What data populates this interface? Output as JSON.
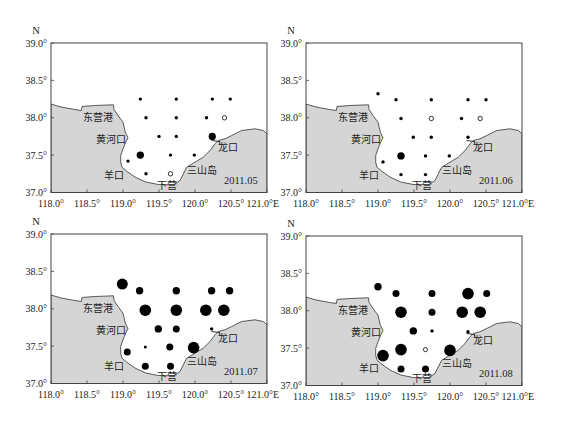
{
  "figure": {
    "axis_label_n": "N",
    "axis_label_e_suffix": "E"
  },
  "map": {
    "land_color": "#d5d5d5",
    "sea_color": "#ffffff",
    "frame_color": "#444444",
    "coast_color": "#333333",
    "dot_color": "#000000",
    "coastline": [
      [
        118.0,
        38.184
      ],
      [
        118.139,
        38.144
      ],
      [
        118.329,
        38.11
      ],
      [
        118.421,
        38.097
      ],
      [
        118.431,
        38.151
      ],
      [
        118.607,
        38.164
      ],
      [
        118.868,
        38.173
      ],
      [
        118.875,
        38.11
      ],
      [
        118.931,
        38.03
      ],
      [
        119.0,
        37.94
      ],
      [
        119.032,
        37.807
      ],
      [
        119.069,
        37.732
      ],
      [
        119.038,
        37.673
      ],
      [
        119.0,
        37.585
      ],
      [
        118.968,
        37.495
      ],
      [
        118.968,
        37.405
      ],
      [
        118.986,
        37.339
      ],
      [
        119.069,
        37.272
      ],
      [
        119.167,
        37.207
      ],
      [
        119.315,
        37.14
      ],
      [
        119.49,
        37.107
      ],
      [
        119.699,
        37.103
      ],
      [
        119.792,
        37.16
      ],
      [
        119.838,
        37.25
      ],
      [
        119.885,
        37.339
      ],
      [
        120.0,
        37.405
      ],
      [
        120.115,
        37.472
      ],
      [
        120.208,
        37.562
      ],
      [
        120.278,
        37.652
      ],
      [
        120.324,
        37.696
      ],
      [
        120.417,
        37.718
      ],
      [
        120.51,
        37.763
      ],
      [
        120.649,
        37.829
      ],
      [
        120.833,
        37.852
      ],
      [
        120.949,
        37.829
      ],
      [
        121.0,
        37.785
      ]
    ],
    "longkou_pier": [
      [
        120.229,
        37.696
      ],
      [
        120.34,
        37.682
      ],
      [
        120.347,
        37.636
      ]
    ],
    "place_labels": [
      {
        "id": "dongying-port",
        "text": "东营港",
        "lon": 118.44,
        "lat": 38.0
      },
      {
        "id": "yellow-river-mouth",
        "text": "黄河口",
        "lon": 118.62,
        "lat": 37.705
      },
      {
        "id": "longkou",
        "text": "龙口",
        "lon": 120.324,
        "lat": 37.606
      },
      {
        "id": "sanshan-island",
        "text": "三山岛",
        "lon": 119.893,
        "lat": 37.294
      },
      {
        "id": "yangkou",
        "text": "羊口",
        "lon": 118.74,
        "lat": 37.227
      },
      {
        "id": "xiaying",
        "text": "下营",
        "lon": 119.468,
        "lat": 37.094
      }
    ],
    "date_label_position": {
      "lon": 120.403,
      "lat": 37.161
    }
  },
  "chart_data": [
    {
      "type": "scatter",
      "subtype": "bubble-map",
      "title": "2011.05",
      "xlabel": "E",
      "ylabel": "N",
      "xlim": [
        118.0,
        121.0
      ],
      "ylim": [
        37.0,
        39.0
      ],
      "xticks": [
        118.0,
        118.5,
        119.0,
        119.5,
        120.0,
        120.5,
        121.0
      ],
      "xtick_labels": [
        "118.0°",
        "118.5°",
        "119.0°",
        "119.5°",
        "120.0°",
        "120.5°",
        "121.0°E"
      ],
      "yticks": [
        37.0,
        37.5,
        38.0,
        38.5,
        39.0
      ],
      "ytick_labels": [
        "37.0°",
        "37.5°",
        "38.0°",
        "38.5°",
        "39.0°"
      ],
      "grid": false,
      "points": [
        {
          "lon": 119.24,
          "lat": 38.25,
          "r": 1.7,
          "filled": true
        },
        {
          "lon": 119.74,
          "lat": 38.25,
          "r": 1.7,
          "filled": true
        },
        {
          "lon": 120.24,
          "lat": 38.25,
          "r": 1.7,
          "filled": true
        },
        {
          "lon": 120.49,
          "lat": 38.25,
          "r": 1.7,
          "filled": true
        },
        {
          "lon": 119.32,
          "lat": 38.0,
          "r": 1.7,
          "filled": true
        },
        {
          "lon": 119.74,
          "lat": 38.0,
          "r": 1.7,
          "filled": true
        },
        {
          "lon": 120.16,
          "lat": 38.0,
          "r": 1.7,
          "filled": true
        },
        {
          "lon": 120.41,
          "lat": 38.0,
          "r": 2.2,
          "filled": false
        },
        {
          "lon": 119.5,
          "lat": 37.75,
          "r": 1.7,
          "filled": true
        },
        {
          "lon": 119.74,
          "lat": 37.75,
          "r": 1.7,
          "filled": true
        },
        {
          "lon": 120.24,
          "lat": 37.75,
          "r": 3.6,
          "filled": true
        },
        {
          "lon": 119.24,
          "lat": 37.5,
          "r": 3.7,
          "filled": true
        },
        {
          "lon": 119.66,
          "lat": 37.5,
          "r": 1.7,
          "filled": true
        },
        {
          "lon": 119.99,
          "lat": 37.5,
          "r": 1.7,
          "filled": true
        },
        {
          "lon": 119.07,
          "lat": 37.42,
          "r": 1.7,
          "filled": true
        },
        {
          "lon": 119.32,
          "lat": 37.25,
          "r": 1.7,
          "filled": true
        },
        {
          "lon": 119.66,
          "lat": 37.25,
          "r": 2.2,
          "filled": false
        }
      ]
    },
    {
      "type": "scatter",
      "subtype": "bubble-map",
      "title": "2011.06",
      "xlabel": "E",
      "ylabel": "N",
      "xlim": [
        118.0,
        121.0
      ],
      "ylim": [
        37.0,
        39.0
      ],
      "xticks": [
        118.0,
        118.5,
        119.0,
        119.5,
        120.0,
        120.5,
        121.0
      ],
      "xtick_labels": [
        "118.0°",
        "118.5°",
        "119.0°",
        "119.5°",
        "120.0°",
        "120.5°",
        "121.0°E"
      ],
      "yticks": [
        37.0,
        37.5,
        38.0,
        38.5,
        39.0
      ],
      "ytick_labels": [
        "37.0°",
        "37.5°",
        "38.0°",
        "38.5°",
        "39.0°"
      ],
      "grid": false,
      "points": [
        {
          "lon": 119.0,
          "lat": 38.32,
          "r": 1.7,
          "filled": true
        },
        {
          "lon": 119.25,
          "lat": 38.24,
          "r": 1.7,
          "filled": true
        },
        {
          "lon": 119.74,
          "lat": 38.24,
          "r": 1.7,
          "filled": true
        },
        {
          "lon": 120.25,
          "lat": 38.24,
          "r": 1.7,
          "filled": true
        },
        {
          "lon": 120.5,
          "lat": 38.24,
          "r": 1.7,
          "filled": true
        },
        {
          "lon": 119.32,
          "lat": 37.99,
          "r": 1.7,
          "filled": true
        },
        {
          "lon": 119.74,
          "lat": 37.99,
          "r": 2.2,
          "filled": false
        },
        {
          "lon": 120.16,
          "lat": 37.99,
          "r": 1.7,
          "filled": true
        },
        {
          "lon": 120.42,
          "lat": 37.99,
          "r": 2.2,
          "filled": false
        },
        {
          "lon": 119.49,
          "lat": 37.74,
          "r": 1.7,
          "filled": true
        },
        {
          "lon": 119.74,
          "lat": 37.74,
          "r": 1.7,
          "filled": true
        },
        {
          "lon": 120.25,
          "lat": 37.74,
          "r": 1.7,
          "filled": true
        },
        {
          "lon": 119.32,
          "lat": 37.49,
          "r": 3.7,
          "filled": true
        },
        {
          "lon": 119.66,
          "lat": 37.49,
          "r": 1.7,
          "filled": true
        },
        {
          "lon": 119.99,
          "lat": 37.49,
          "r": 1.7,
          "filled": true
        },
        {
          "lon": 119.07,
          "lat": 37.41,
          "r": 1.7,
          "filled": true
        },
        {
          "lon": 119.32,
          "lat": 37.24,
          "r": 1.7,
          "filled": true
        },
        {
          "lon": 119.66,
          "lat": 37.24,
          "r": 1.7,
          "filled": true
        }
      ]
    },
    {
      "type": "scatter",
      "subtype": "bubble-map",
      "title": "2011.07",
      "xlabel": "E",
      "ylabel": "N",
      "xlim": [
        118.0,
        121.0
      ],
      "ylim": [
        37.0,
        39.0
      ],
      "xticks": [
        118.0,
        118.5,
        119.0,
        119.5,
        120.0,
        120.5,
        121.0
      ],
      "xtick_labels": [
        "118.0°",
        "118.5°",
        "119.0°",
        "119.5°",
        "120.0°",
        "120.5°",
        "121.0°E"
      ],
      "yticks": [
        37.0,
        37.5,
        38.0,
        38.5,
        39.0
      ],
      "ytick_labels": [
        "37.0°",
        "37.5°",
        "38.0°",
        "38.5°",
        "39.0°"
      ],
      "grid": false,
      "points": [
        {
          "lon": 118.99,
          "lat": 38.33,
          "r": 5.5,
          "filled": true
        },
        {
          "lon": 119.23,
          "lat": 38.24,
          "r": 3.7,
          "filled": true
        },
        {
          "lon": 119.74,
          "lat": 38.24,
          "r": 3.7,
          "filled": true
        },
        {
          "lon": 120.23,
          "lat": 38.24,
          "r": 3.7,
          "filled": true
        },
        {
          "lon": 120.48,
          "lat": 38.24,
          "r": 3.7,
          "filled": true
        },
        {
          "lon": 119.31,
          "lat": 37.98,
          "r": 5.8,
          "filled": true
        },
        {
          "lon": 119.74,
          "lat": 37.98,
          "r": 5.8,
          "filled": true
        },
        {
          "lon": 120.15,
          "lat": 37.98,
          "r": 5.8,
          "filled": true
        },
        {
          "lon": 120.4,
          "lat": 37.98,
          "r": 5.8,
          "filled": true
        },
        {
          "lon": 119.49,
          "lat": 37.73,
          "r": 3.7,
          "filled": true
        },
        {
          "lon": 119.74,
          "lat": 37.73,
          "r": 3.5,
          "filled": true
        },
        {
          "lon": 120.23,
          "lat": 37.73,
          "r": 1.7,
          "filled": true
        },
        {
          "lon": 119.31,
          "lat": 37.49,
          "r": 1.5,
          "filled": true
        },
        {
          "lon": 119.65,
          "lat": 37.49,
          "r": 3.5,
          "filled": true
        },
        {
          "lon": 119.98,
          "lat": 37.48,
          "r": 5.8,
          "filled": true
        },
        {
          "lon": 119.06,
          "lat": 37.42,
          "r": 3.5,
          "filled": true
        },
        {
          "lon": 119.31,
          "lat": 37.23,
          "r": 3.5,
          "filled": true
        },
        {
          "lon": 119.66,
          "lat": 37.23,
          "r": 3.5,
          "filled": true
        }
      ]
    },
    {
      "type": "scatter",
      "subtype": "bubble-map",
      "title": "2011.08",
      "xlabel": "E",
      "ylabel": "N",
      "xlim": [
        118.0,
        121.0
      ],
      "ylim": [
        37.0,
        39.0
      ],
      "xticks": [
        118.0,
        118.5,
        119.0,
        119.5,
        120.0,
        120.5,
        121.0
      ],
      "xtick_labels": [
        "118.0°",
        "118.5°",
        "119.0°",
        "119.5°",
        "120.0°",
        "120.5°",
        "121.0°E"
      ],
      "yticks": [
        37.0,
        37.5,
        38.0,
        38.5,
        39.0
      ],
      "ytick_labels": [
        "37.0°",
        "37.5°",
        "38.0°",
        "38.5°",
        "39.0°"
      ],
      "grid": false,
      "points": [
        {
          "lon": 119.0,
          "lat": 38.32,
          "r": 3.7,
          "filled": true
        },
        {
          "lon": 119.25,
          "lat": 38.23,
          "r": 3.5,
          "filled": true
        },
        {
          "lon": 119.75,
          "lat": 38.23,
          "r": 3.5,
          "filled": true
        },
        {
          "lon": 120.25,
          "lat": 38.23,
          "r": 5.8,
          "filled": true
        },
        {
          "lon": 120.51,
          "lat": 38.23,
          "r": 3.5,
          "filled": true
        },
        {
          "lon": 119.32,
          "lat": 37.98,
          "r": 5.8,
          "filled": true
        },
        {
          "lon": 119.75,
          "lat": 37.98,
          "r": 3.5,
          "filled": true
        },
        {
          "lon": 120.17,
          "lat": 37.98,
          "r": 5.8,
          "filled": true
        },
        {
          "lon": 120.42,
          "lat": 37.98,
          "r": 5.8,
          "filled": true
        },
        {
          "lon": 119.49,
          "lat": 37.73,
          "r": 3.7,
          "filled": true
        },
        {
          "lon": 119.75,
          "lat": 37.73,
          "r": 1.7,
          "filled": true
        },
        {
          "lon": 120.25,
          "lat": 37.72,
          "r": 1.7,
          "filled": true
        },
        {
          "lon": 119.07,
          "lat": 37.4,
          "r": 5.8,
          "filled": true
        },
        {
          "lon": 119.32,
          "lat": 37.48,
          "r": 5.8,
          "filled": true
        },
        {
          "lon": 119.66,
          "lat": 37.48,
          "r": 2.1,
          "filled": false
        },
        {
          "lon": 120.0,
          "lat": 37.47,
          "r": 5.8,
          "filled": true
        },
        {
          "lon": 119.32,
          "lat": 37.22,
          "r": 3.5,
          "filled": true
        },
        {
          "lon": 119.66,
          "lat": 37.22,
          "r": 3.5,
          "filled": true
        }
      ]
    }
  ]
}
